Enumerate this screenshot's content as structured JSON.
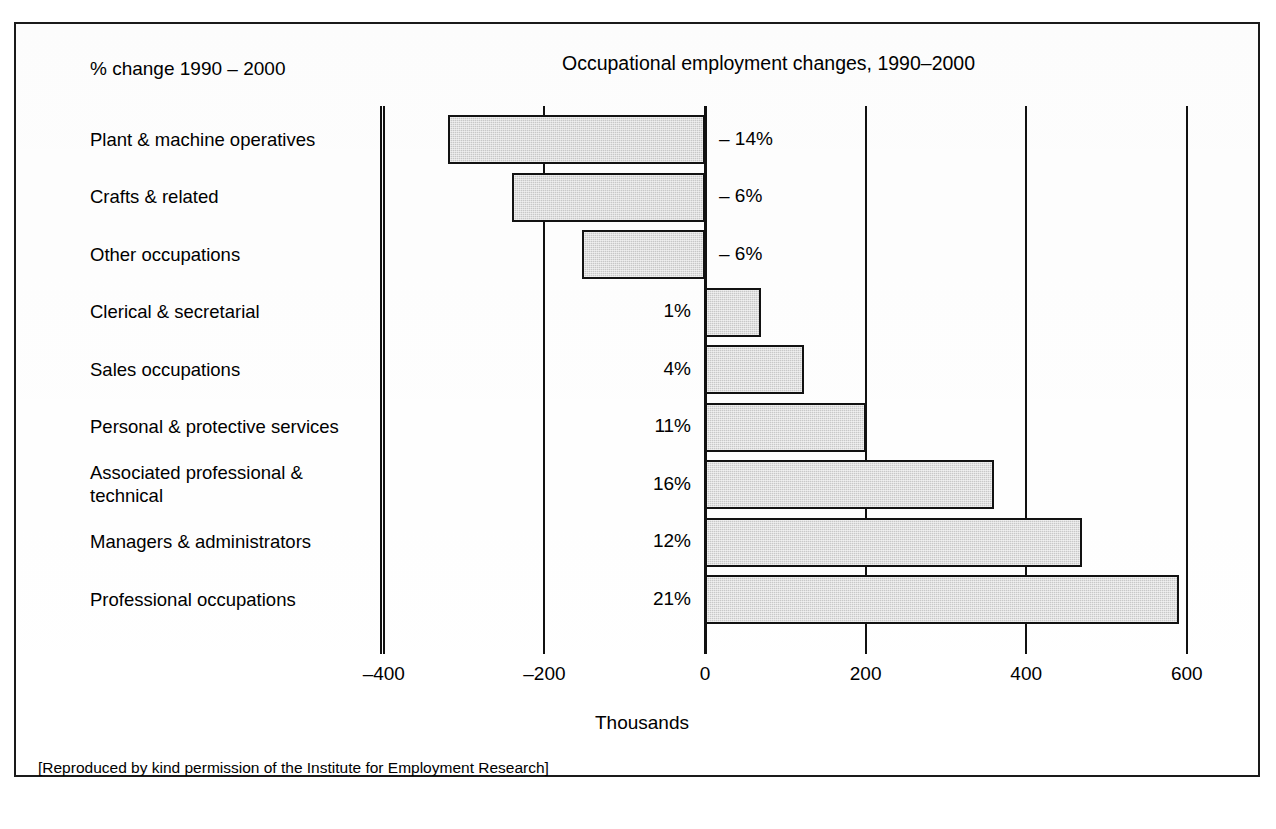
{
  "page": {
    "top_heading": "",
    "footer_credit": "[Reproduced by kind permission of the Institute for Employment Research]",
    "legend_note": "% change 1990 – 2000"
  },
  "colors": {
    "bar_fill": "#c9c9c9",
    "bar_stroke": "#121212",
    "axis": "#111111",
    "frame": "#1a1a1a",
    "text": "#000000"
  },
  "chart_data": {
    "type": "bar",
    "orientation": "horizontal",
    "title": "Occupational employment changes, 1990–2000",
    "subtitle": "",
    "xlabel": "Thousands",
    "ylabel": "",
    "xlim": [
      -480,
      620
    ],
    "xticks": [
      -400,
      -200,
      0,
      200,
      400,
      600
    ],
    "xtick_labels": [
      "–400",
      "–200",
      "0",
      "200",
      "400",
      "600"
    ],
    "grid": true,
    "legend": "none",
    "categories": [
      "Plant & machine operatives",
      "Crafts & related",
      "Other occupations",
      "Clerical & secretarial",
      "Sales occupations",
      "Personal & protective services",
      "Associated professional &\ntechnical",
      "Managers & administrators",
      "Professional occupations"
    ],
    "values": [
      -320,
      -240,
      -153,
      70,
      123,
      200,
      360,
      470,
      590
    ],
    "value_unit": "thousands",
    "data_labels": [
      "– 14%",
      "– 6%",
      "– 6%",
      "1%",
      "4%",
      "11%",
      "16%",
      "12%",
      "21%"
    ],
    "data_label_meaning": "% change 1990 – 2000"
  }
}
